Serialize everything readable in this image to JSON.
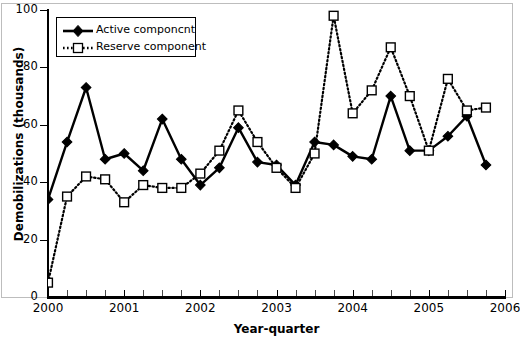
{
  "chart_data": {
    "type": "line",
    "title": "",
    "xlabel": "Year-quarter",
    "ylabel": "Demobilizations (thousands)",
    "ylim": [
      0,
      100
    ],
    "yticks": [
      0,
      20,
      40,
      60,
      80,
      100
    ],
    "xlim": [
      2000.0,
      2006.0
    ],
    "xticks": [
      2000,
      2001,
      2002,
      2003,
      2004,
      2005,
      2006
    ],
    "xtick_labels": [
      "2000",
      "2001",
      "2002",
      "2003",
      "2004",
      "2005",
      "2006"
    ],
    "minor_x_interval_quarters": 1,
    "grid": false,
    "legend_position": "upper-left",
    "x": [
      2000.0,
      2000.25,
      2000.5,
      2000.75,
      2001.0,
      2001.25,
      2001.5,
      2001.75,
      2002.0,
      2002.25,
      2002.5,
      2002.75,
      2003.0,
      2003.25,
      2003.5,
      2003.75,
      2004.0,
      2004.25,
      2004.5,
      2004.75,
      2005.0,
      2005.25,
      2005.5,
      2005.75
    ],
    "series": [
      {
        "name": "Active componcnt",
        "marker": "filled-diamond",
        "linestyle": "solid",
        "color": "#000000",
        "values": [
          34,
          54,
          73,
          48,
          50,
          44,
          62,
          48,
          39,
          45,
          59,
          47,
          46,
          39,
          54,
          53,
          49,
          48,
          70,
          51,
          51,
          56,
          63,
          46
        ]
      },
      {
        "name": "Reserve component",
        "marker": "open-square",
        "linestyle": "dotted",
        "color": "#000000",
        "values": [
          5,
          35,
          42,
          41,
          33,
          39,
          38,
          38,
          43,
          51,
          65,
          54,
          45,
          38,
          50,
          98,
          64,
          72,
          87,
          70,
          51,
          76,
          65,
          66
        ]
      }
    ]
  },
  "legend": {
    "items": [
      {
        "label": "Active componcnt",
        "key": "solid-diamond"
      },
      {
        "label": "Reserve component",
        "key": "dotted-square"
      }
    ]
  },
  "axes": {
    "y_title": "Demobilizations (thousands)",
    "x_title": "Year-quarter",
    "y_tick_labels": [
      "100",
      "80",
      "60",
      "40",
      "20",
      "0"
    ],
    "x_tick_labels": [
      "2000",
      "2001",
      "2002",
      "2003",
      "2004",
      "2005",
      "2006"
    ]
  }
}
